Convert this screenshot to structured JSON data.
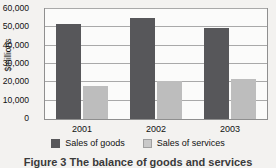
{
  "caption": "Figure 3  The balance of goods and services",
  "colors": {
    "goods": "#57575a",
    "services": "#bdbdbd",
    "plot_background": "#fbfbfa",
    "page_background": "#f3f2f0",
    "gridline": "#a9a9a9",
    "axis": "#8f8f8f"
  },
  "legend": {
    "position": "bottom",
    "items": [
      {
        "label": "Sales of goods",
        "swatch": "goods"
      },
      {
        "label": "Sales of services",
        "swatch": "services"
      }
    ]
  },
  "chart_data": {
    "type": "bar",
    "title": "",
    "subtitle": "",
    "xlabel": "",
    "ylabel": "$millions",
    "categories": [
      "2001",
      "2002",
      "2003"
    ],
    "series": [
      {
        "name": "Sales of goods",
        "values": [
          52000,
          55000,
          49500
        ]
      },
      {
        "name": "Sales of services",
        "values": [
          18000,
          20500,
          22000
        ]
      }
    ],
    "ylim": [
      0,
      60000
    ],
    "ytick_values": [
      0,
      10000,
      20000,
      30000,
      40000,
      50000,
      60000
    ],
    "ytick_labels": [
      "0",
      "10,000",
      "20,000",
      "30,000",
      "40,000",
      "50,000",
      "60,000"
    ],
    "grid": true,
    "grid_axis": "y",
    "legend_position": "bottom"
  }
}
